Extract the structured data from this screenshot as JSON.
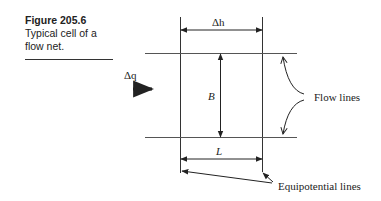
{
  "caption": {
    "figure_number": "Figure 205.6",
    "text": "Typical cell of a flow net."
  },
  "diagram": {
    "labels": {
      "delta_h": "Δh",
      "delta_q": "Δq",
      "B": "B",
      "L": "L",
      "flow_lines": "Flow lines",
      "equipotential_lines": "Equipotential lines"
    },
    "colors": {
      "line": "#222222",
      "background": "#ffffff"
    }
  }
}
